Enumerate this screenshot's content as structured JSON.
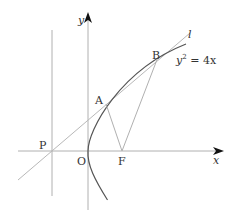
{
  "diagram": {
    "type": "parabola-geometry",
    "curve_label": "y² = 4x",
    "curve_label_base": "y",
    "curve_label_exp": "2",
    "curve_label_rest": " = 4x",
    "line_label": "l",
    "axes": {
      "x_label": "x",
      "y_label": "y"
    },
    "points": {
      "P": "P",
      "O": "O",
      "F": "F",
      "A": "A",
      "B": "B"
    },
    "colors": {
      "axis": "#aaaaaa",
      "curve": "#555555",
      "line": "#b0b0b0",
      "segments": "#aaaaaa",
      "text": "#333333"
    }
  }
}
